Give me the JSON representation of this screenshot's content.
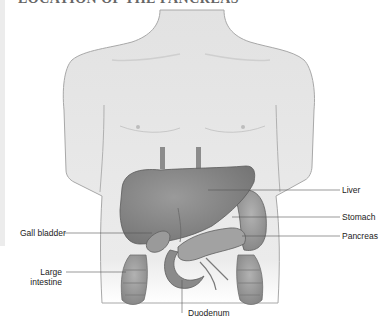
{
  "title": "LOCATION OF THE PANCREAS",
  "figure": {
    "colors": {
      "skin": "#e4e4e4",
      "skin_edge": "#9a9a9a",
      "liver": "#8a8a8a",
      "organ": "#a5a5a5",
      "organ_dark": "#6e6e6e",
      "leader_line": "#555555"
    }
  },
  "labels": {
    "liver": "Liver",
    "stomach": "Stomach",
    "pancreas": "Pancreas",
    "gall_bladder": "Gall bladder",
    "large_intestine_line1": "Large",
    "large_intestine_line2": "intestine",
    "duodenum": "Duodenum"
  }
}
